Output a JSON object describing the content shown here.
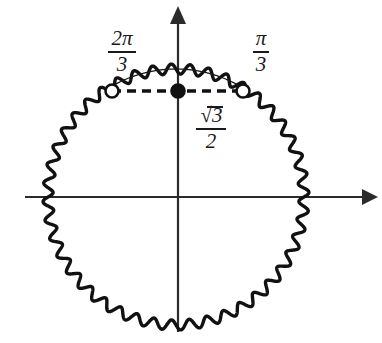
{
  "figure": {
    "type": "unit-circle-diagram",
    "background_color": "#ffffff",
    "ink_color": "#1a1a1a"
  },
  "axes": {
    "x_axis": {
      "name": "x-axis",
      "y": 197,
      "x_start": 25,
      "x_end": 372,
      "arrow": "right"
    },
    "y_axis": {
      "name": "y-axis",
      "x": 178,
      "y_start": 8,
      "y_end": 332,
      "arrow": "up"
    },
    "origin": {
      "x": 178,
      "y": 197
    }
  },
  "circle": {
    "center_x": 176,
    "center_y": 197,
    "radius": 128,
    "wave_amplitude": 5,
    "wave_cycles": 44,
    "stroke_width": 3.4,
    "smooth_arc_from_deg": 60,
    "smooth_arc_to_deg": 120,
    "smooth_arc_stroke_width": 1.3
  },
  "points": [
    {
      "name": "point-2pi-over-3",
      "style": "open",
      "x": 112,
      "y": 91,
      "radius": 6.5,
      "angle_label": "2π/3"
    },
    {
      "name": "point-center-value",
      "style": "filled",
      "x": 178,
      "y": 91,
      "radius": 6.5,
      "value_label": "√3/2"
    },
    {
      "name": "point-pi-over-3",
      "style": "open",
      "x": 243,
      "y": 91,
      "radius": 6.5,
      "angle_label": "π/3"
    }
  ],
  "dashed_line": {
    "name": "horizontal-dashed-chord",
    "y": 91,
    "x_start": 112,
    "x_end": 243,
    "dash": "9 6",
    "stroke_width": 3.4
  },
  "labels": {
    "angle_left": {
      "name": "label-2pi-over-3",
      "numerator": "2π",
      "denominator": "3",
      "full": "2π/3"
    },
    "angle_right": {
      "name": "label-pi-over-3",
      "numerator": "π",
      "denominator": "3",
      "full": "π/3"
    },
    "value": {
      "name": "label-sqrt3-over-2",
      "numerator": "3",
      "numerator_prefix": "√",
      "denominator": "2",
      "full": "√3/2"
    }
  }
}
